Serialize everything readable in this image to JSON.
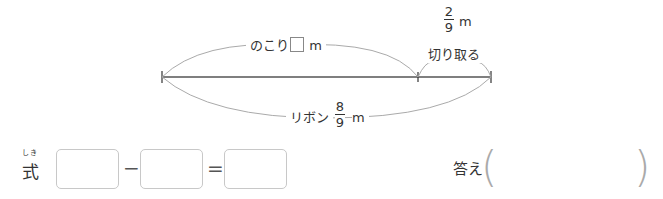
{
  "diagram": {
    "remaining_label": "のこり",
    "remaining_unit": "m",
    "cut_fraction": {
      "numerator": "2",
      "denominator": "9"
    },
    "cut_unit": "m",
    "cut_label": "切り取る",
    "ribbon_label": "リボン",
    "ribbon_fraction": {
      "numerator": "8",
      "denominator": "9"
    },
    "ribbon_unit": "m"
  },
  "equation": {
    "label": "式",
    "ruby": "しき",
    "operator": "−",
    "equals": "=",
    "boxes": [
      "",
      "",
      ""
    ]
  },
  "answer": {
    "label": "答え",
    "open_paren": "(",
    "close_paren": ")",
    "value": ""
  }
}
